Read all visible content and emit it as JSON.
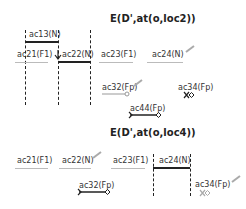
{
  "diagrams": [
    {
      "title": "E(D',at(o,loc2))",
      "labels": {
        "ac13": "ac13(N)",
        "ac21": "ac21(F1)",
        "ac22": "ac22(N)",
        "ac23": "ac23(F1)",
        "ac24": "ac24(N)",
        "ac32": "ac32(Fp)",
        "ac34": "ac34(Fp)",
        "ac44": "ac44(Fp)"
      }
    },
    {
      "title": "E(D',at(o,loc4))",
      "labels": {
        "ac21": "ac21(F1)",
        "ac22": "ac22(N)",
        "ac23": "ac23(F1)",
        "ac24": "ac24(N)",
        "ac32": "ac32(Fp)",
        "ac34": "ac34(Fp)"
      }
    }
  ],
  "colors": {
    "line": "#222222",
    "faint": "#bbbbbb",
    "arrow": "#aaaaaa"
  }
}
